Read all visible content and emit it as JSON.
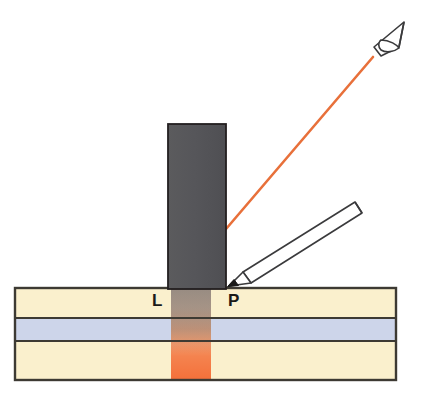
{
  "diagram": {
    "canvas": {
      "width": 424,
      "height": 406,
      "background": "#ffffff"
    },
    "labels": {
      "point_l": "L",
      "point_p": "P"
    },
    "icons": {
      "viewer": "eye-icon",
      "probe": "pencil-icon",
      "ray": "light-ray-line"
    },
    "colors": {
      "ray_orange": "#E8703A",
      "block_gray": "#58585A",
      "block_outline": "#231F20",
      "layer_cream": "#FAF0CD",
      "layer_blue": "#CDD5EA",
      "layer_outline": "#3D3A33",
      "illuminated_orange_top": "#F6DCC8",
      "illuminated_orange_bottom": "#F4743E",
      "shadow_overlay": "#4A4442",
      "pencil_body": "#FFFFFF",
      "pencil_outline": "#3A3A3C",
      "pencil_tip": "#1A1A1A",
      "eye_outline": "#3A3A3C"
    },
    "geometry": {
      "slab": {
        "x": 15,
        "y": 288,
        "width": 381,
        "height": 92
      },
      "blue_band": {
        "y": 318,
        "height": 23
      },
      "gray_block": {
        "x": 168,
        "y": 124,
        "width": 58,
        "height": 164
      },
      "illuminated_band": {
        "x": 171,
        "width": 40
      },
      "ray": {
        "x1": 226,
        "y1": 229,
        "x2": 373,
        "y2": 57
      },
      "label_l": {
        "x": 152,
        "y": 305
      },
      "label_p": {
        "x": 228,
        "y": 305
      }
    }
  }
}
